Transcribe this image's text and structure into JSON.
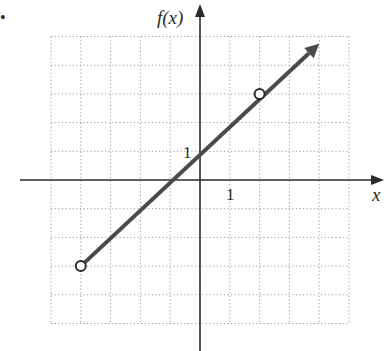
{
  "bullet": "•",
  "chart_data": {
    "type": "line",
    "title": "",
    "xlabel": "x",
    "ylabel": "f(x)",
    "tick_labels": {
      "x": "1",
      "y": "1"
    },
    "xlim": [
      -5,
      5
    ],
    "ylim": [
      -5,
      5
    ],
    "grid": true,
    "grid_style": "dotted",
    "function": "f(x) = x + 1",
    "series": [
      {
        "name": "f(x)",
        "points": [
          [
            -4,
            -3
          ],
          [
            2,
            3
          ],
          [
            4,
            5
          ]
        ],
        "start": {
          "x": -4,
          "y": -3,
          "marker": "open-circle"
        },
        "hole": {
          "x": 2,
          "y": 3,
          "marker": "open-circle"
        },
        "end": {
          "x": 4,
          "y": 4.75,
          "marker": "arrow"
        }
      }
    ],
    "colors": {
      "line": "#4a4a4a",
      "axis": "#2a2a2a",
      "grid": "#9a9a9a"
    }
  }
}
